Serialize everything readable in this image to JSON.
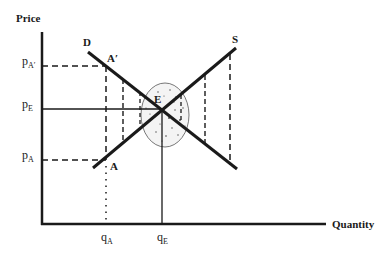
{
  "diagram": {
    "type": "supply-demand",
    "axes": {
      "y_label": "Price",
      "x_label": "Quantity"
    },
    "curves": {
      "demand": {
        "label": "D"
      },
      "supply": {
        "label": "S"
      }
    },
    "points": {
      "a_prime": {
        "label": "A′"
      },
      "equilibrium": {
        "label": "E"
      },
      "a": {
        "label": "A"
      }
    },
    "y_ticks": {
      "p_a_prime": {
        "main": "p",
        "sub": "A′"
      },
      "p_e": {
        "main": "p",
        "sub": "E"
      },
      "p_a": {
        "main": "p",
        "sub": "A"
      }
    },
    "x_ticks": {
      "q_a": {
        "main": "q",
        "sub": "A"
      },
      "q_e": {
        "main": "q",
        "sub": "E"
      }
    },
    "colors": {
      "line": "#1a1a1a",
      "background": "#ffffff",
      "ellipse_fill": "#f4f4f4"
    }
  }
}
